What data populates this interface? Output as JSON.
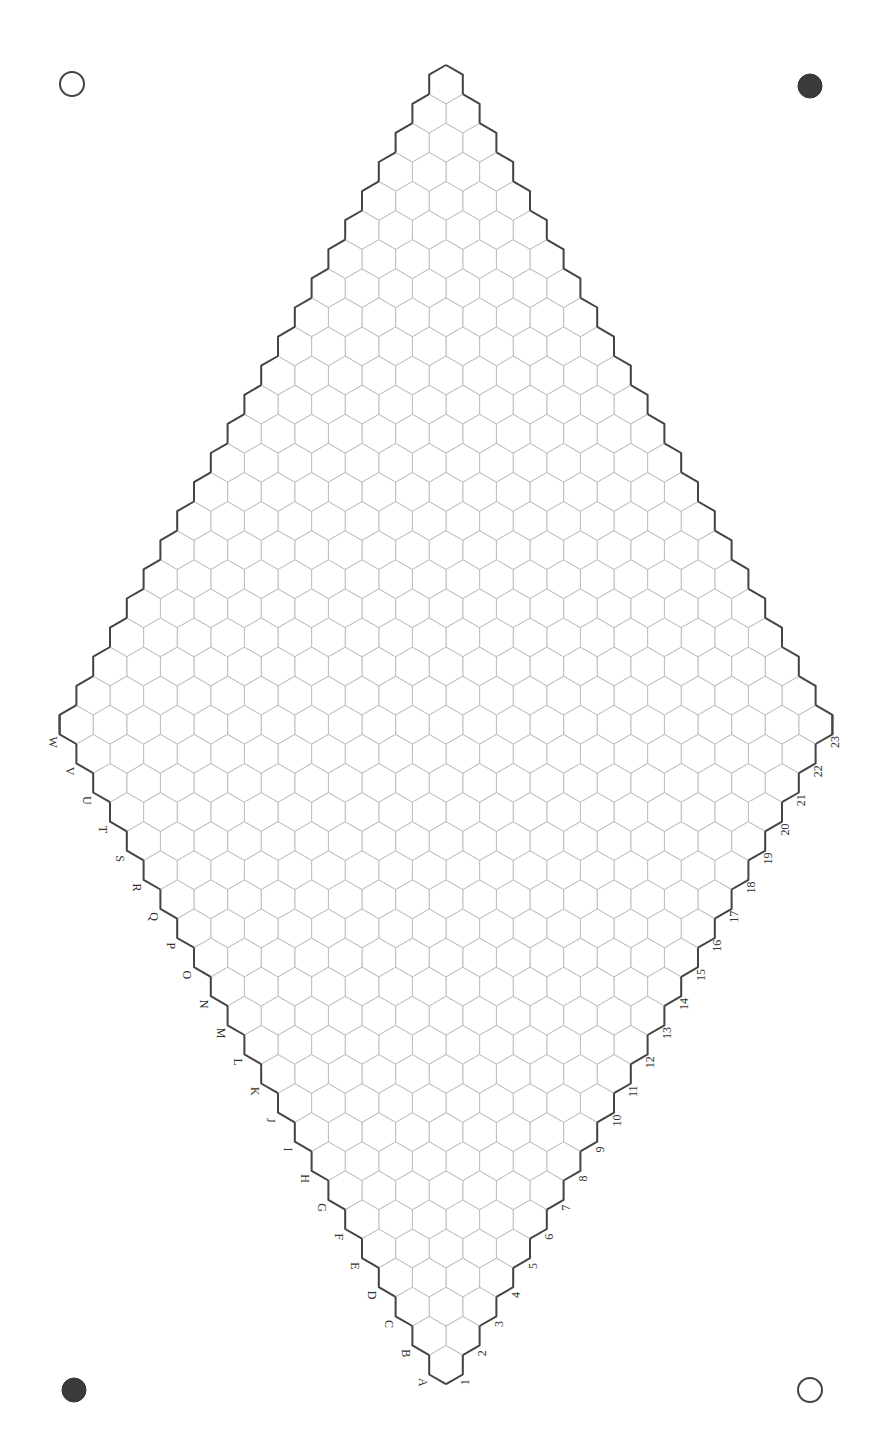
{
  "board": {
    "title": "Hex board 23x23",
    "size": 23,
    "row_labels": [
      "A",
      "B",
      "C",
      "D",
      "E",
      "F",
      "G",
      "H",
      "I",
      "J",
      "K",
      "L",
      "M",
      "N",
      "O",
      "P",
      "Q",
      "R",
      "S",
      "T",
      "U",
      "V",
      "W"
    ],
    "column_labels": [
      "1",
      "2",
      "3",
      "4",
      "5",
      "6",
      "7",
      "8",
      "9",
      "10",
      "11",
      "12",
      "13",
      "14",
      "15",
      "16",
      "17",
      "18",
      "19",
      "20",
      "21",
      "22",
      "23"
    ],
    "geometry": {
      "center_x": 446,
      "top_y": 65,
      "hex_side": 19.4,
      "hex_width": 33.6
    },
    "colors": {
      "grid_line": "#b8b8b8",
      "border": "#444444",
      "label": "#333333",
      "stone_dark": "#3a3a3a"
    }
  },
  "corner_markers": [
    {
      "position": "top-left",
      "type": "open",
      "cx": 72,
      "cy": 84,
      "r": 12
    },
    {
      "position": "top-right",
      "type": "filled",
      "cx": 810,
      "cy": 86,
      "r": 12
    },
    {
      "position": "bottom-left",
      "type": "filled",
      "cx": 74,
      "cy": 1390,
      "r": 12
    },
    {
      "position": "bottom-right",
      "type": "open",
      "cx": 810,
      "cy": 1390,
      "r": 12
    }
  ]
}
